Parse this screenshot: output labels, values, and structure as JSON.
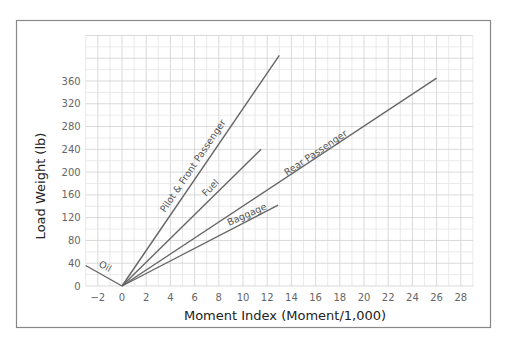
{
  "chart_data": {
    "type": "line",
    "title": "",
    "xlabel": "Moment Index (Moment/1,000)",
    "ylabel": "Load Weight (lb)",
    "xlim": [
      -3,
      29
    ],
    "ylim": [
      0,
      440
    ],
    "x_ticks": [
      -2,
      0,
      2,
      4,
      6,
      8,
      10,
      12,
      14,
      16,
      18,
      20,
      22,
      24,
      26,
      28
    ],
    "y_ticks": [
      0,
      40,
      80,
      120,
      160,
      200,
      240,
      280,
      320,
      360
    ],
    "grid": true,
    "legend": "inline labels along lines",
    "series": [
      {
        "name": "Oil",
        "points": [
          [
            -3,
            36
          ],
          [
            0,
            0
          ]
        ]
      },
      {
        "name": "Pilot & Front Passenger",
        "points": [
          [
            0,
            0
          ],
          [
            13.0,
            405
          ]
        ]
      },
      {
        "name": "Fuel",
        "points": [
          [
            0,
            0
          ],
          [
            11.5,
            240
          ]
        ]
      },
      {
        "name": "Rear Passenger",
        "points": [
          [
            0,
            0
          ],
          [
            26.0,
            365
          ]
        ]
      },
      {
        "name": "Baggage",
        "points": [
          [
            0,
            0
          ],
          [
            12.9,
            142
          ]
        ]
      }
    ]
  },
  "labels": {
    "xlabel": "Moment Index (Moment/1,000)",
    "ylabel": "Load Weight (lb)",
    "oil": "Oil",
    "pilot": "Pilot & Front Passenger",
    "fuel": "Fuel",
    "rear": "Rear Passenger",
    "baggage": "Baggage"
  },
  "ticks": {
    "x": [
      "−2",
      "0",
      "2",
      "4",
      "6",
      "8",
      "10",
      "12",
      "14",
      "16",
      "18",
      "20",
      "22",
      "24",
      "26",
      "28"
    ],
    "y": [
      "0",
      "40",
      "80",
      "120",
      "160",
      "200",
      "240",
      "280",
      "320",
      "360"
    ]
  }
}
